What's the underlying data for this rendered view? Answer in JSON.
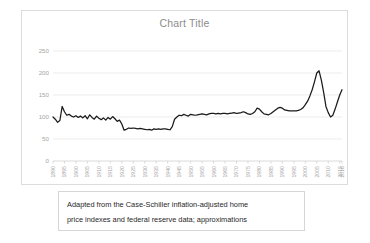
{
  "chart_card": {
    "title": "Chart Title",
    "title_color": "#8c8c8c",
    "border_color": "#dcdcdc",
    "background": "#ffffff"
  },
  "caption": {
    "line1": "Adapted from the Case-Schiller inflation-adjusted  home",
    "line2": "price indexes and federal reserve data; approximations"
  },
  "chart_data": {
    "type": "line",
    "title": "Chart Title",
    "xlabel": "",
    "ylabel": "",
    "ylim": [
      0,
      250
    ],
    "xlim": [
      1890,
      2016
    ],
    "grid": true,
    "legend": false,
    "line_color": "#1a1a1a",
    "ytick_labels": [
      "0",
      "50",
      "100",
      "150",
      "200",
      "250"
    ],
    "yticks": [
      0,
      50,
      100,
      150,
      200,
      250
    ],
    "xtick_labels": [
      "1890",
      "1895",
      "1900",
      "1905",
      "1910",
      "1915",
      "1920",
      "1925",
      "1930",
      "1935",
      "1940",
      "1945",
      "1950",
      "1955",
      "1960",
      "1965",
      "1970",
      "1975",
      "1980",
      "1985",
      "1990",
      "1995",
      "2000",
      "2005",
      "2010",
      "2015",
      "2016"
    ],
    "xticks": [
      1890,
      1895,
      1900,
      1905,
      1910,
      1915,
      1920,
      1925,
      1930,
      1935,
      1940,
      1945,
      1950,
      1955,
      1960,
      1965,
      1970,
      1975,
      1980,
      1985,
      1990,
      1995,
      2000,
      2005,
      2010,
      2015,
      2016
    ],
    "series": [
      {
        "name": "Case-Schiller inflation-adjusted home price index",
        "x": [
          1890,
          1891,
          1892,
          1893,
          1894,
          1895,
          1896,
          1897,
          1898,
          1899,
          1900,
          1901,
          1902,
          1903,
          1904,
          1905,
          1906,
          1907,
          1908,
          1909,
          1910,
          1911,
          1912,
          1913,
          1914,
          1915,
          1916,
          1917,
          1918,
          1919,
          1920,
          1921,
          1922,
          1923,
          1924,
          1925,
          1926,
          1927,
          1928,
          1929,
          1930,
          1931,
          1932,
          1933,
          1934,
          1935,
          1936,
          1937,
          1938,
          1939,
          1940,
          1941,
          1942,
          1943,
          1944,
          1945,
          1946,
          1947,
          1948,
          1949,
          1950,
          1951,
          1952,
          1953,
          1954,
          1955,
          1956,
          1957,
          1958,
          1959,
          1960,
          1961,
          1962,
          1963,
          1964,
          1965,
          1966,
          1967,
          1968,
          1969,
          1970,
          1971,
          1972,
          1973,
          1974,
          1975,
          1976,
          1977,
          1978,
          1979,
          1980,
          1981,
          1982,
          1983,
          1984,
          1985,
          1986,
          1987,
          1988,
          1989,
          1990,
          1991,
          1992,
          1993,
          1994,
          1995,
          1996,
          1997,
          1998,
          1999,
          2000,
          2001,
          2002,
          2003,
          2004,
          2005,
          2006,
          2007,
          2008,
          2009,
          2010,
          2011,
          2012,
          2013,
          2014,
          2015,
          2016
        ],
        "values": [
          100,
          95,
          88,
          92,
          124,
          112,
          104,
          106,
          102,
          100,
          103,
          99,
          102,
          98,
          103,
          96,
          105,
          99,
          95,
          102,
          97,
          94,
          98,
          93,
          99,
          95,
          101,
          96,
          90,
          93,
          84,
          70,
          72,
          75,
          74,
          75,
          74,
          73,
          74,
          73,
          72,
          71,
          72,
          70,
          73,
          72,
          73,
          72,
          73,
          73,
          72,
          71,
          78,
          95,
          100,
          104,
          103,
          106,
          104,
          102,
          106,
          105,
          104,
          105,
          106,
          107,
          106,
          105,
          107,
          108,
          108,
          107,
          108,
          107,
          108,
          108,
          107,
          108,
          109,
          110,
          108,
          109,
          110,
          112,
          110,
          107,
          106,
          108,
          112,
          120,
          118,
          112,
          107,
          106,
          105,
          108,
          112,
          116,
          120,
          122,
          120,
          116,
          115,
          114,
          114,
          114,
          114,
          115,
          117,
          121,
          128,
          136,
          148,
          162,
          180,
          200,
          205,
          184,
          156,
          124,
          110,
          100,
          104,
          118,
          134,
          150,
          162
        ]
      }
    ],
    "annotations": []
  }
}
